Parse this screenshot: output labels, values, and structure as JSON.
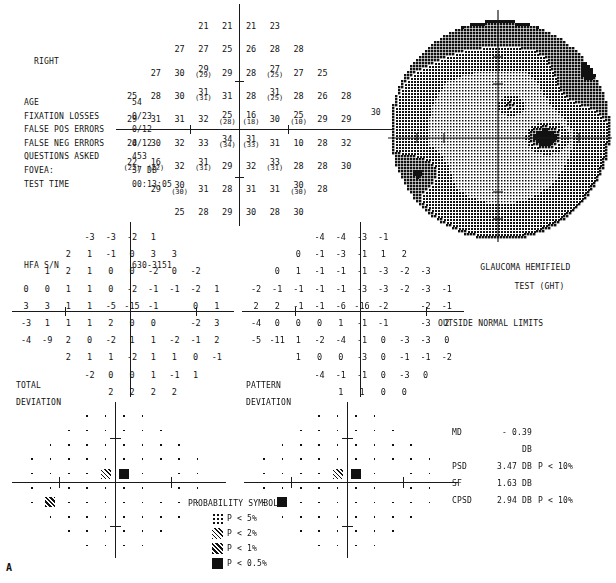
{
  "header": {
    "eye": "RIGHT",
    "rows": [
      {
        "label": "AGE",
        "value": "54"
      },
      {
        "label": "FIXATION LOSSES",
        "value": "0/23"
      },
      {
        "label": "FALSE POS ERRORS",
        "value": "0/12"
      },
      {
        "label": "FALSE NEG ERRORS",
        "value": "0/12"
      },
      {
        "label": "QUESTIONS ASKED",
        "value": "453"
      },
      {
        "label": "FOVEA:",
        "value": "37 DB"
      },
      {
        "label": "TEST TIME",
        "value": "00:13:05"
      }
    ],
    "serial_label": "HFA S/N",
    "serial_value": "630-3151"
  },
  "threshold": {
    "axis_label": "30",
    "cells": [
      {
        "x": 3,
        "y": 0,
        "v": "21"
      },
      {
        "x": 4,
        "y": 0,
        "v": "21"
      },
      {
        "x": 5,
        "y": 0,
        "v": "21"
      },
      {
        "x": 6,
        "y": 0,
        "v": "23"
      },
      {
        "x": 2,
        "y": 1,
        "v": "27"
      },
      {
        "x": 3,
        "y": 1,
        "v": "27"
      },
      {
        "x": 4,
        "y": 1,
        "v": "25"
      },
      {
        "x": 5,
        "y": 1,
        "v": "26"
      },
      {
        "x": 6,
        "y": 1,
        "v": "28"
      },
      {
        "x": 7,
        "y": 1,
        "v": "28"
      },
      {
        "x": 1,
        "y": 2,
        "v": "27"
      },
      {
        "x": 2,
        "y": 2,
        "v": "30"
      },
      {
        "x": 3,
        "y": 2,
        "v": "29",
        "p": "(29)"
      },
      {
        "x": 4,
        "y": 2,
        "v": "29"
      },
      {
        "x": 5,
        "y": 2,
        "v": "28"
      },
      {
        "x": 6,
        "y": 2,
        "v": "27",
        "p": "(25)"
      },
      {
        "x": 7,
        "y": 2,
        "v": "27"
      },
      {
        "x": 8,
        "y": 2,
        "v": "25"
      },
      {
        "x": 0,
        "y": 3,
        "v": "25"
      },
      {
        "x": 1,
        "y": 3,
        "v": "28"
      },
      {
        "x": 2,
        "y": 3,
        "v": "30"
      },
      {
        "x": 3,
        "y": 3,
        "v": "31",
        "p": "(31)"
      },
      {
        "x": 4,
        "y": 3,
        "v": "31"
      },
      {
        "x": 5,
        "y": 3,
        "v": "28"
      },
      {
        "x": 6,
        "y": 3,
        "v": "31",
        "p": "(25)"
      },
      {
        "x": 7,
        "y": 3,
        "v": "28"
      },
      {
        "x": 8,
        "y": 3,
        "v": "26"
      },
      {
        "x": 9,
        "y": 3,
        "v": "28"
      },
      {
        "x": 0,
        "y": 4,
        "v": "29"
      },
      {
        "x": 1,
        "y": 4,
        "v": "31"
      },
      {
        "x": 2,
        "y": 4,
        "v": "31"
      },
      {
        "x": 3,
        "y": 4,
        "v": "32"
      },
      {
        "x": 4,
        "y": 4,
        "v": "25",
        "p": "(28)"
      },
      {
        "x": 5,
        "y": 4,
        "v": "16",
        "p": "(18)"
      },
      {
        "x": 6,
        "y": 4,
        "v": "30"
      },
      {
        "x": 7,
        "y": 4,
        "v": "25",
        "p": "(10)"
      },
      {
        "x": 8,
        "y": 4,
        "v": "29"
      },
      {
        "x": 9,
        "y": 4,
        "v": "29"
      },
      {
        "x": 0,
        "y": 5,
        "v": "24"
      },
      {
        "x": 1,
        "y": 5,
        "v": "30"
      },
      {
        "x": 2,
        "y": 5,
        "v": "32"
      },
      {
        "x": 3,
        "y": 5,
        "v": "33"
      },
      {
        "x": 4,
        "y": 5,
        "v": "34",
        "p": "(34)"
      },
      {
        "x": 5,
        "y": 5,
        "v": "31",
        "p": "(33)"
      },
      {
        "x": 6,
        "y": 5,
        "v": "31"
      },
      {
        "x": 7,
        "y": 5,
        "v": "10"
      },
      {
        "x": 8,
        "y": 5,
        "v": "28"
      },
      {
        "x": 9,
        "y": 5,
        "v": "32"
      },
      {
        "x": 0,
        "y": 6,
        "v": "22",
        "p": "(22)"
      },
      {
        "x": 1,
        "y": 6,
        "v": "16",
        "p": "(22)"
      },
      {
        "x": 2,
        "y": 6,
        "v": "32"
      },
      {
        "x": 3,
        "y": 6,
        "v": "31",
        "p": "(31)"
      },
      {
        "x": 4,
        "y": 6,
        "v": "29"
      },
      {
        "x": 5,
        "y": 6,
        "v": "32"
      },
      {
        "x": 6,
        "y": 6,
        "v": "33",
        "p": "(31)"
      },
      {
        "x": 7,
        "y": 6,
        "v": "28"
      },
      {
        "x": 8,
        "y": 6,
        "v": "28"
      },
      {
        "x": 9,
        "y": 6,
        "v": "30"
      },
      {
        "x": 1,
        "y": 7,
        "v": "29"
      },
      {
        "x": 2,
        "y": 7,
        "v": "30",
        "p": "(30)"
      },
      {
        "x": 3,
        "y": 7,
        "v": "31"
      },
      {
        "x": 4,
        "y": 7,
        "v": "28"
      },
      {
        "x": 5,
        "y": 7,
        "v": "31"
      },
      {
        "x": 6,
        "y": 7,
        "v": "31"
      },
      {
        "x": 7,
        "y": 7,
        "v": "30",
        "p": "(30)"
      },
      {
        "x": 8,
        "y": 7,
        "v": "28"
      },
      {
        "x": 2,
        "y": 8,
        "v": "25"
      },
      {
        "x": 3,
        "y": 8,
        "v": "28"
      },
      {
        "x": 4,
        "y": 8,
        "v": "29"
      },
      {
        "x": 5,
        "y": 8,
        "v": "30"
      },
      {
        "x": 6,
        "y": 8,
        "v": "28"
      },
      {
        "x": 7,
        "y": 8,
        "v": "30"
      }
    ]
  },
  "total_deviation": {
    "label_line1": "TOTAL",
    "label_line2": "DEVIATION",
    "cells": [
      {
        "x": 3,
        "y": 0,
        "v": "-3"
      },
      {
        "x": 4,
        "y": 0,
        "v": "-3"
      },
      {
        "x": 5,
        "y": 0,
        "v": "-2"
      },
      {
        "x": 6,
        "y": 0,
        "v": "1"
      },
      {
        "x": 2,
        "y": 1,
        "v": "2"
      },
      {
        "x": 3,
        "y": 1,
        "v": "1"
      },
      {
        "x": 4,
        "y": 1,
        "v": "-1"
      },
      {
        "x": 5,
        "y": 1,
        "v": "0"
      },
      {
        "x": 6,
        "y": 1,
        "v": "3"
      },
      {
        "x": 7,
        "y": 1,
        "v": "3"
      },
      {
        "x": 1,
        "y": 2,
        "v": "1"
      },
      {
        "x": 2,
        "y": 2,
        "v": "2"
      },
      {
        "x": 3,
        "y": 2,
        "v": "1"
      },
      {
        "x": 4,
        "y": 2,
        "v": "0"
      },
      {
        "x": 5,
        "y": 2,
        "v": "0"
      },
      {
        "x": 6,
        "y": 2,
        "v": "-2"
      },
      {
        "x": 7,
        "y": 2,
        "v": "0"
      },
      {
        "x": 8,
        "y": 2,
        "v": "-2"
      },
      {
        "x": 0,
        "y": 3,
        "v": "0"
      },
      {
        "x": 1,
        "y": 3,
        "v": "0"
      },
      {
        "x": 2,
        "y": 3,
        "v": "1"
      },
      {
        "x": 3,
        "y": 3,
        "v": "1"
      },
      {
        "x": 4,
        "y": 3,
        "v": "0"
      },
      {
        "x": 5,
        "y": 3,
        "v": "-2"
      },
      {
        "x": 6,
        "y": 3,
        "v": "-1"
      },
      {
        "x": 7,
        "y": 3,
        "v": "-1"
      },
      {
        "x": 8,
        "y": 3,
        "v": "-2"
      },
      {
        "x": 9,
        "y": 3,
        "v": "1"
      },
      {
        "x": 0,
        "y": 4,
        "v": "3"
      },
      {
        "x": 1,
        "y": 4,
        "v": "3"
      },
      {
        "x": 2,
        "y": 4,
        "v": "1"
      },
      {
        "x": 3,
        "y": 4,
        "v": "1"
      },
      {
        "x": 4,
        "y": 4,
        "v": "-5"
      },
      {
        "x": 5,
        "y": 4,
        "v": "-15"
      },
      {
        "x": 6,
        "y": 4,
        "v": "-1"
      },
      {
        "x": 8,
        "y": 4,
        "v": "0"
      },
      {
        "x": 9,
        "y": 4,
        "v": "1"
      },
      {
        "x": 0,
        "y": 5,
        "v": "-3"
      },
      {
        "x": 1,
        "y": 5,
        "v": "1"
      },
      {
        "x": 2,
        "y": 5,
        "v": "1"
      },
      {
        "x": 3,
        "y": 5,
        "v": "1"
      },
      {
        "x": 4,
        "y": 5,
        "v": "2"
      },
      {
        "x": 5,
        "y": 5,
        "v": "0"
      },
      {
        "x": 6,
        "y": 5,
        "v": "0"
      },
      {
        "x": 8,
        "y": 5,
        "v": "-2"
      },
      {
        "x": 9,
        "y": 5,
        "v": "3"
      },
      {
        "x": 0,
        "y": 6,
        "v": "-4"
      },
      {
        "x": 1,
        "y": 6,
        "v": "-9"
      },
      {
        "x": 2,
        "y": 6,
        "v": "2"
      },
      {
        "x": 3,
        "y": 6,
        "v": "0"
      },
      {
        "x": 4,
        "y": 6,
        "v": "-2"
      },
      {
        "x": 5,
        "y": 6,
        "v": "1"
      },
      {
        "x": 6,
        "y": 6,
        "v": "1"
      },
      {
        "x": 7,
        "y": 6,
        "v": "-2"
      },
      {
        "x": 8,
        "y": 6,
        "v": "-1"
      },
      {
        "x": 9,
        "y": 6,
        "v": "2"
      },
      {
        "x": 2,
        "y": 7,
        "v": "2"
      },
      {
        "x": 3,
        "y": 7,
        "v": "1"
      },
      {
        "x": 4,
        "y": 7,
        "v": "1"
      },
      {
        "x": 5,
        "y": 7,
        "v": "-2"
      },
      {
        "x": 6,
        "y": 7,
        "v": "1"
      },
      {
        "x": 7,
        "y": 7,
        "v": "1"
      },
      {
        "x": 8,
        "y": 7,
        "v": "0"
      },
      {
        "x": 9,
        "y": 7,
        "v": "-1"
      },
      {
        "x": 3,
        "y": 8,
        "v": "-2"
      },
      {
        "x": 4,
        "y": 8,
        "v": "0"
      },
      {
        "x": 5,
        "y": 8,
        "v": "0"
      },
      {
        "x": 6,
        "y": 8,
        "v": "1"
      },
      {
        "x": 7,
        "y": 8,
        "v": "-1"
      },
      {
        "x": 8,
        "y": 8,
        "v": "1"
      },
      {
        "x": 4,
        "y": 9,
        "v": "2"
      },
      {
        "x": 5,
        "y": 9,
        "v": "2"
      },
      {
        "x": 6,
        "y": 9,
        "v": "2"
      },
      {
        "x": 7,
        "y": 9,
        "v": "2"
      }
    ]
  },
  "pattern_deviation": {
    "label_line1": "PATTERN",
    "label_line2": "DEVIATION",
    "cells": [
      {
        "x": 3,
        "y": 0,
        "v": "-4"
      },
      {
        "x": 4,
        "y": 0,
        "v": "-4"
      },
      {
        "x": 5,
        "y": 0,
        "v": "-3"
      },
      {
        "x": 6,
        "y": 0,
        "v": "-1"
      },
      {
        "x": 2,
        "y": 1,
        "v": "0"
      },
      {
        "x": 3,
        "y": 1,
        "v": "-1"
      },
      {
        "x": 4,
        "y": 1,
        "v": "-3"
      },
      {
        "x": 5,
        "y": 1,
        "v": "-1"
      },
      {
        "x": 6,
        "y": 1,
        "v": "1"
      },
      {
        "x": 7,
        "y": 1,
        "v": "2"
      },
      {
        "x": 1,
        "y": 2,
        "v": "0"
      },
      {
        "x": 2,
        "y": 2,
        "v": "1"
      },
      {
        "x": 3,
        "y": 2,
        "v": "-1"
      },
      {
        "x": 4,
        "y": 2,
        "v": "-1"
      },
      {
        "x": 5,
        "y": 2,
        "v": "-1"
      },
      {
        "x": 6,
        "y": 2,
        "v": "-3"
      },
      {
        "x": 7,
        "y": 2,
        "v": "-2"
      },
      {
        "x": 8,
        "y": 2,
        "v": "-3"
      },
      {
        "x": 0,
        "y": 3,
        "v": "-2"
      },
      {
        "x": 1,
        "y": 3,
        "v": "-1"
      },
      {
        "x": 2,
        "y": 3,
        "v": "-1"
      },
      {
        "x": 3,
        "y": 3,
        "v": "-1"
      },
      {
        "x": 4,
        "y": 3,
        "v": "-1"
      },
      {
        "x": 5,
        "y": 3,
        "v": "-3"
      },
      {
        "x": 6,
        "y": 3,
        "v": "-3"
      },
      {
        "x": 7,
        "y": 3,
        "v": "-2"
      },
      {
        "x": 8,
        "y": 3,
        "v": "-3"
      },
      {
        "x": 9,
        "y": 3,
        "v": "-1"
      },
      {
        "x": 0,
        "y": 4,
        "v": "2"
      },
      {
        "x": 1,
        "y": 4,
        "v": "2"
      },
      {
        "x": 2,
        "y": 4,
        "v": "-1"
      },
      {
        "x": 3,
        "y": 4,
        "v": "-1"
      },
      {
        "x": 4,
        "y": 4,
        "v": "-6"
      },
      {
        "x": 5,
        "y": 4,
        "v": "-16"
      },
      {
        "x": 6,
        "y": 4,
        "v": "-2"
      },
      {
        "x": 8,
        "y": 4,
        "v": "-2"
      },
      {
        "x": 9,
        "y": 4,
        "v": "-1"
      },
      {
        "x": 0,
        "y": 5,
        "v": "-4"
      },
      {
        "x": 1,
        "y": 5,
        "v": "0"
      },
      {
        "x": 2,
        "y": 5,
        "v": "0"
      },
      {
        "x": 3,
        "y": 5,
        "v": "0"
      },
      {
        "x": 4,
        "y": 5,
        "v": "1"
      },
      {
        "x": 5,
        "y": 5,
        "v": "-1"
      },
      {
        "x": 6,
        "y": 5,
        "v": "-1"
      },
      {
        "x": 8,
        "y": 5,
        "v": "-3"
      },
      {
        "x": 9,
        "y": 5,
        "v": "2"
      },
      {
        "x": 0,
        "y": 6,
        "v": "-5"
      },
      {
        "x": 1,
        "y": 6,
        "v": "-11"
      },
      {
        "x": 2,
        "y": 6,
        "v": "1"
      },
      {
        "x": 3,
        "y": 6,
        "v": "-2"
      },
      {
        "x": 4,
        "y": 6,
        "v": "-4"
      },
      {
        "x": 5,
        "y": 6,
        "v": "-1"
      },
      {
        "x": 6,
        "y": 6,
        "v": "0"
      },
      {
        "x": 7,
        "y": 6,
        "v": "-3"
      },
      {
        "x": 8,
        "y": 6,
        "v": "-3"
      },
      {
        "x": 9,
        "y": 6,
        "v": "0"
      },
      {
        "x": 2,
        "y": 7,
        "v": "1"
      },
      {
        "x": 3,
        "y": 7,
        "v": "0"
      },
      {
        "x": 4,
        "y": 7,
        "v": "0"
      },
      {
        "x": 5,
        "y": 7,
        "v": "-3"
      },
      {
        "x": 6,
        "y": 7,
        "v": "0"
      },
      {
        "x": 7,
        "y": 7,
        "v": "-1"
      },
      {
        "x": 8,
        "y": 7,
        "v": "-1"
      },
      {
        "x": 9,
        "y": 7,
        "v": "-2"
      },
      {
        "x": 3,
        "y": 8,
        "v": "-4"
      },
      {
        "x": 4,
        "y": 8,
        "v": "-1"
      },
      {
        "x": 5,
        "y": 8,
        "v": "-1"
      },
      {
        "x": 6,
        "y": 8,
        "v": "0"
      },
      {
        "x": 7,
        "y": 8,
        "v": "-3"
      },
      {
        "x": 8,
        "y": 8,
        "v": "0"
      },
      {
        "x": 4,
        "y": 9,
        "v": "1"
      },
      {
        "x": 5,
        "y": 9,
        "v": "1"
      },
      {
        "x": 6,
        "y": 9,
        "v": "0"
      },
      {
        "x": 7,
        "y": 9,
        "v": "0"
      }
    ]
  },
  "total_deviation_plot": {
    "symbols": [
      {
        "x": 4,
        "y": 4,
        "level": "s2"
      },
      {
        "x": 5,
        "y": 4,
        "level": "s05"
      },
      {
        "x": 1,
        "y": 6,
        "level": "s1"
      }
    ]
  },
  "pattern_deviation_plot": {
    "symbols": [
      {
        "x": 4,
        "y": 4,
        "level": "s2"
      },
      {
        "x": 5,
        "y": 4,
        "level": "s05"
      },
      {
        "x": 1,
        "y": 6,
        "level": "s05"
      }
    ]
  },
  "ght": {
    "line1": "GLAUCOMA HEMIFIELD",
    "line2": "TEST (GHT)",
    "result": "OUTSIDE NORMAL LIMITS"
  },
  "stats": [
    {
      "key": "MD",
      "value": "- 0.39 DB",
      "prob": ""
    },
    {
      "key": "PSD",
      "value": "3.47 DB",
      "prob": "P <  10%"
    },
    {
      "key": "SF",
      "value": "1.63 DB",
      "prob": ""
    },
    {
      "key": "CPSD",
      "value": "2.94 DB",
      "prob": "P <  10%"
    }
  ],
  "legend": {
    "title": "PROBABILITY SYMBOLS",
    "items": [
      {
        "level": "s5",
        "text": "P <   5%"
      },
      {
        "level": "s2",
        "text": "P <   2%"
      },
      {
        "level": "s1",
        "text": "P <   1%"
      },
      {
        "level": "s05",
        "text": "P < 0.5%"
      }
    ]
  },
  "grayscale": {
    "axis_label": "30"
  },
  "figure_label": "A"
}
